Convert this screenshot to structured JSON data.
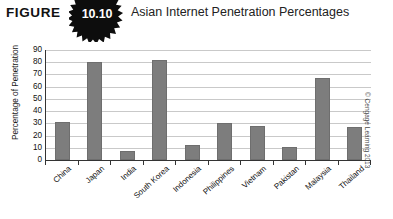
{
  "header": {
    "figure_word": "FIGURE",
    "figure_number": "10.10",
    "title": "Asian Internet Penetration Percentages",
    "badge_icon": "starburst-badge-icon"
  },
  "credit": "© Cengage Learning 2013",
  "chart_data": {
    "type": "bar",
    "title": "Asian Internet Penetration Percentages",
    "xlabel": "",
    "ylabel": "Percentage of Penetration",
    "ylim": [
      0,
      90
    ],
    "ytick_step": 10,
    "yticks": [
      "0",
      "10",
      "20",
      "30",
      "40",
      "50",
      "60",
      "70",
      "80",
      "90"
    ],
    "grid": true,
    "legend": "none",
    "bar_color": "#7d7d7d",
    "categories": [
      "China",
      "Japan",
      "India",
      "South Korea",
      "Indonesia",
      "Philippines",
      "Vietnam",
      "Pakistan",
      "Malaysia",
      "Thailand"
    ],
    "values": [
      31,
      80,
      7,
      82,
      12,
      30,
      28,
      11,
      67,
      27
    ]
  }
}
